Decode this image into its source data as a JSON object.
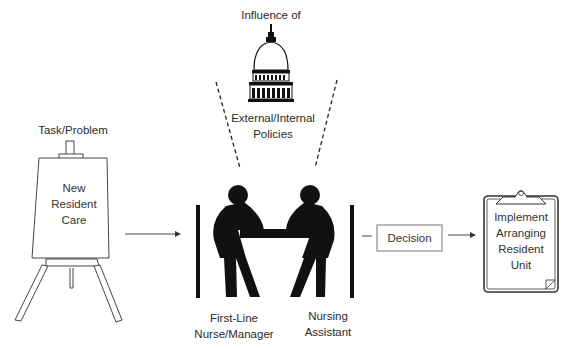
{
  "diagram": {
    "influence": {
      "title": "Influence of",
      "icon": "capitol-building-icon",
      "subtitle_line1": "External/Internal",
      "subtitle_line2": "Policies"
    },
    "task": {
      "heading": "Task/Problem",
      "icon": "easel-icon",
      "line1": "New",
      "line2": "Resident",
      "line3": "Care"
    },
    "meeting": {
      "icon": "two-people-at-table-icon",
      "left_person_line1": "First-Line",
      "left_person_line2": "Nurse/Manager",
      "right_person_line1": "Nursing",
      "right_person_line2": "Assistant"
    },
    "decision": {
      "label": "Decision"
    },
    "outcome": {
      "icon": "clipboard-icon",
      "line1": "Implement",
      "line2": "Arranging",
      "line3": "Resident",
      "line4": "Unit"
    },
    "colors": {
      "ink": "#111111",
      "text": "#2a2a2a",
      "line": "#555555"
    }
  }
}
